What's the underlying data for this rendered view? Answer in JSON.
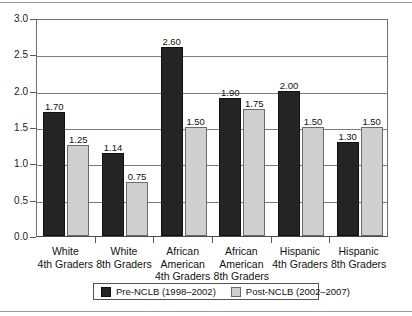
{
  "chart_data": {
    "type": "bar",
    "title": "",
    "subtitle": "",
    "xlabel": "",
    "ylabel": "",
    "ylim": [
      0.0,
      3.0
    ],
    "ytick_labels": [
      "0.0",
      "0.5",
      "1.0",
      "1.5",
      "2.0",
      "2.5",
      "3.0"
    ],
    "ytick_values": [
      0.0,
      0.5,
      1.0,
      1.5,
      2.0,
      2.5,
      3.0
    ],
    "grid": true,
    "legend_position": "bottom",
    "categories": [
      "White\n4th Graders",
      "White\n8th Graders",
      "African\nAmerican\n4th Graders",
      "African\nAmerican\n8th Graders",
      "Hispanic\n4th Graders",
      "Hispanic\n8th Graders"
    ],
    "series": [
      {
        "name": "Pre-NCLB (1998–2002)",
        "color": "#242424",
        "values": [
          1.7,
          1.14,
          2.6,
          1.9,
          2.0,
          1.3
        ],
        "labels": [
          "1.70",
          "1.14",
          "2.60",
          "1.90",
          "2.00",
          "1.30"
        ]
      },
      {
        "name": "Post-NCLB (2002–2007)",
        "color": "#cfcfcf",
        "values": [
          1.25,
          0.75,
          1.5,
          1.75,
          1.5,
          1.5
        ],
        "labels": [
          "1.25",
          "0.75",
          "1.50",
          "1.75",
          "1.50",
          "1.50"
        ]
      }
    ]
  },
  "legend": {
    "items": [
      {
        "label": "Pre-NCLB (1998–2002)"
      },
      {
        "label": "Post-NCLB (2002–2007)"
      }
    ]
  }
}
